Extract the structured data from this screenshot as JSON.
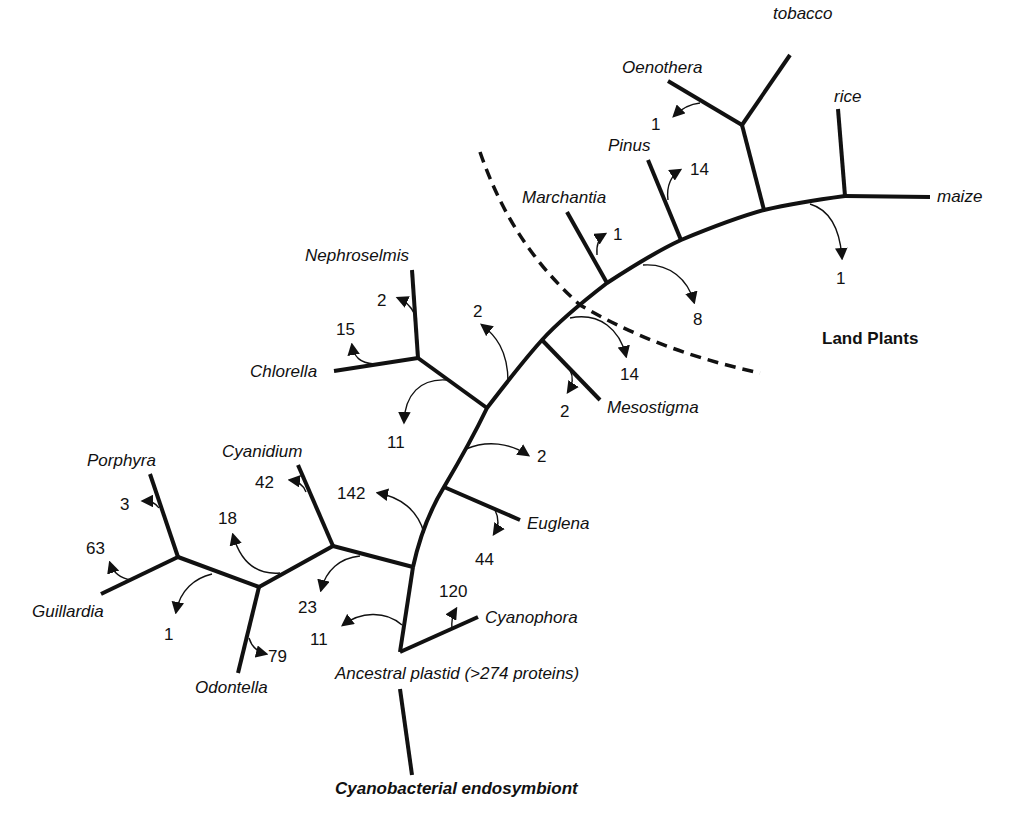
{
  "diagram": {
    "type": "unrooted phylogenetic tree of plastid gene loss",
    "root_label": "Cyanobacterial endosymbiont",
    "ancestor_label": "Ancestral plastid (>274 proteins)",
    "group_label": "Land Plants",
    "taxa": {
      "tobacco": "tobacco",
      "oenothera": "Oenothera",
      "rice": "rice",
      "maize": "maize",
      "pinus": "Pinus",
      "marchantia": "Marchantia",
      "nephroselmis": "Nephroselmis",
      "chlorella": "Chlorella",
      "mesostigma": "Mesostigma",
      "euglena": "Euglena",
      "cyanophora": "Cyanophora",
      "cyanidium": "Cyanidium",
      "porphyra": "Porphyra",
      "guillardia": "Guillardia",
      "odontella": "Odontella"
    },
    "losses": {
      "oenothera": "1",
      "maize_rice_branch": "1",
      "pinus": "14",
      "marchantia": "1",
      "seed_plants_branch": "8",
      "land_plants_branch": "14",
      "mesostigma": "2",
      "nephroselmis": "2",
      "chlorella": "15",
      "green_branch": "2",
      "chlorophyte_branch": "11",
      "euglena_branch": "2",
      "euglena": "44",
      "green_lineage_branch": "142",
      "cyanophora": "120",
      "red_lineage_branch": "11",
      "cyanidium": "42",
      "red_internal_branch": "23",
      "chromist_branch": "18",
      "porphyra": "3",
      "guillardia": "63",
      "porphyra_guillardia_branch": "1",
      "odontella": "79"
    }
  }
}
